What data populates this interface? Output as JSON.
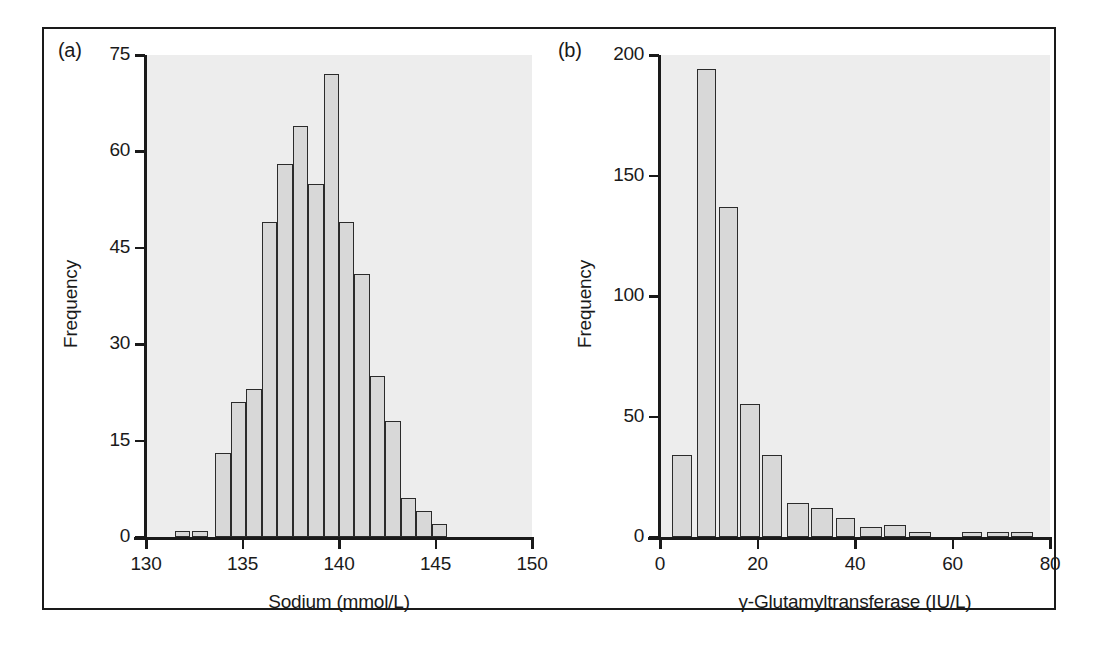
{
  "figure": {
    "background_color": "#ffffff",
    "frame_color": "#1a1a1a",
    "plot_background_color": "#ededed",
    "bar_fill_color": "#d8d8d8",
    "bar_edge_color": "#2b2b2b"
  },
  "panels": {
    "a": {
      "letter": "(a)",
      "ylabel": "Frequency",
      "xlabel": "Sodium (mmol/L)",
      "ytick_labels": [
        "0",
        "15",
        "30",
        "45",
        "60",
        "75"
      ],
      "xtick_labels": [
        "130",
        "135",
        "140",
        "145",
        "150"
      ]
    },
    "b": {
      "letter": "(b)",
      "ylabel": "Frequency",
      "xlabel": "γ-Glutamyltransferase (IU/L)",
      "ytick_labels": [
        "0",
        "50",
        "100",
        "150",
        "200"
      ],
      "xtick_labels": [
        "0",
        "20",
        "40",
        "60",
        "80"
      ]
    }
  },
  "chart_data": [
    {
      "type": "bar",
      "panel": "a",
      "title": "",
      "xlabel": "Sodium (mmol/L)",
      "ylabel": "Frequency",
      "xlim": [
        130,
        150
      ],
      "ylim": [
        0,
        75
      ],
      "xticks": [
        130,
        135,
        140,
        145,
        150
      ],
      "yticks": [
        0,
        15,
        30,
        45,
        60,
        75
      ],
      "grid": false,
      "legend": false,
      "bin_width": 0.5,
      "bin_starts": [
        131.5,
        132.0,
        134.0,
        134.5,
        135.0,
        136.5,
        137.0,
        137.5,
        138.0,
        138.5,
        139.0,
        139.5,
        140.0,
        140.5,
        141.0,
        141.5,
        142.0
      ],
      "categories": [
        "131.5–132.0",
        "132.0–132.5",
        "134.0–134.5",
        "134.5–135.0",
        "135.0–135.5",
        "136.5–137.0",
        "137.0–137.5",
        "137.5–138.0",
        "138.0–138.5",
        "138.5–139.0",
        "139.0–139.5",
        "139.5–140.0",
        "140.0–140.5",
        "140.5–141.0",
        "141.0–141.5",
        "141.5–142.0",
        "142.0–142.5"
      ],
      "bars": [
        {
          "x0": 131.5,
          "x1": 132.3,
          "value": 1
        },
        {
          "x0": 132.4,
          "x1": 133.2,
          "value": 1
        },
        {
          "x0": 133.6,
          "x1": 134.4,
          "value": 13
        },
        {
          "x0": 134.4,
          "x1": 135.2,
          "value": 21
        },
        {
          "x0": 135.2,
          "x1": 136.0,
          "value": 23
        },
        {
          "x0": 136.0,
          "x1": 136.8,
          "value": 49
        },
        {
          "x0": 136.8,
          "x1": 137.6,
          "value": 58
        },
        {
          "x0": 137.6,
          "x1": 138.4,
          "value": 64
        },
        {
          "x0": 138.4,
          "x1": 139.2,
          "value": 55
        },
        {
          "x0": 139.2,
          "x1": 140.0,
          "value": 72
        },
        {
          "x0": 140.0,
          "x1": 140.8,
          "value": 49
        },
        {
          "x0": 140.8,
          "x1": 141.6,
          "value": 41
        },
        {
          "x0": 141.6,
          "x1": 142.4,
          "value": 25
        },
        {
          "x0": 142.4,
          "x1": 143.2,
          "value": 18
        },
        {
          "x0": 143.2,
          "x1": 144.0,
          "value": 6
        },
        {
          "x0": 144.0,
          "x1": 144.8,
          "value": 4
        },
        {
          "x0": 144.8,
          "x1": 145.6,
          "value": 2
        }
      ],
      "values": [
        1,
        1,
        13,
        21,
        23,
        49,
        58,
        64,
        55,
        72,
        49,
        41,
        25,
        18,
        6,
        4,
        2
      ]
    },
    {
      "type": "bar",
      "panel": "b",
      "title": "",
      "xlabel": "γ-Glutamyltransferase (IU/L)",
      "ylabel": "Frequency",
      "xlim": [
        0,
        80
      ],
      "ylim": [
        0,
        200
      ],
      "xticks": [
        0,
        20,
        40,
        60,
        80
      ],
      "yticks": [
        0,
        50,
        100,
        150,
        200
      ],
      "grid": false,
      "legend": false,
      "bin_width": 5,
      "categories": [
        "0–5",
        "5–10",
        "10–15",
        "15–20",
        "20–25",
        "25–30",
        "30–35",
        "35–40",
        "40–45",
        "45–50",
        "50–55",
        "55–60",
        "60–65",
        "65–70",
        "70–75"
      ],
      "bars": [
        {
          "x0": 2.5,
          "x1": 6.5,
          "value": 34
        },
        {
          "x0": 7.5,
          "x1": 11.5,
          "value": 194
        },
        {
          "x0": 12.0,
          "x1": 16.0,
          "value": 137
        },
        {
          "x0": 16.5,
          "x1": 20.5,
          "value": 55
        },
        {
          "x0": 21.0,
          "x1": 25.0,
          "value": 34
        },
        {
          "x0": 26.0,
          "x1": 30.5,
          "value": 14
        },
        {
          "x0": 31.0,
          "x1": 35.5,
          "value": 12
        },
        {
          "x0": 36.0,
          "x1": 40.0,
          "value": 8
        },
        {
          "x0": 41.0,
          "x1": 45.5,
          "value": 4
        },
        {
          "x0": 46.0,
          "x1": 50.5,
          "value": 5
        },
        {
          "x0": 51.0,
          "x1": 55.5,
          "value": 2
        },
        {
          "x0": 62.0,
          "x1": 66.0,
          "value": 2
        },
        {
          "x0": 67.0,
          "x1": 71.5,
          "value": 2
        },
        {
          "x0": 72.0,
          "x1": 76.5,
          "value": 2
        }
      ],
      "values": [
        34,
        194,
        137,
        55,
        34,
        14,
        12,
        8,
        4,
        5,
        2,
        0,
        2,
        2,
        2
      ]
    }
  ]
}
